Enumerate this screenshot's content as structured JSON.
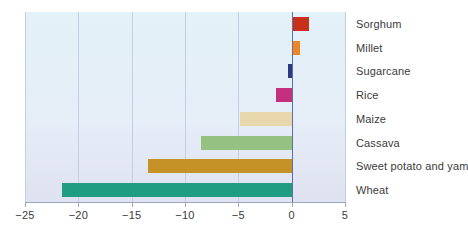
{
  "chart_data": {
    "type": "bar",
    "orientation": "horizontal",
    "title": "",
    "subtitle": "",
    "xlabel": "",
    "ylabel": "",
    "xlim": [
      -25,
      5
    ],
    "ylim": null,
    "grid": true,
    "legend": null,
    "xticks": [
      -25,
      -20,
      -15,
      -10,
      -5,
      0,
      5
    ],
    "xtick_labels": [
      "−25",
      "−20",
      "−15",
      "−10",
      "−5",
      "0",
      "5"
    ],
    "categories": [
      "Sorghum",
      "Millet",
      "Sugarcane",
      "Rice",
      "Maize",
      "Cassava",
      "Sweet potato and yam",
      "Wheat"
    ],
    "values": [
      1.6,
      0.8,
      -0.3,
      -1.5,
      -4.8,
      -8.5,
      -13.5,
      -21.5
    ],
    "colors": [
      "#c8301e",
      "#ef8524",
      "#2b3a80",
      "#c4307d",
      "#e8d7ad",
      "#95c183",
      "#c59228",
      "#1f9c81"
    ]
  },
  "style": {
    "plot_background_top": "#e3f1f8",
    "plot_background_bottom": "#dfe2f0",
    "gridline_color": "#c2cfe0",
    "zero_line_color": "#5b6fa8",
    "axis_color": "#9aa7bd",
    "text_color": "#3b3b3b"
  }
}
